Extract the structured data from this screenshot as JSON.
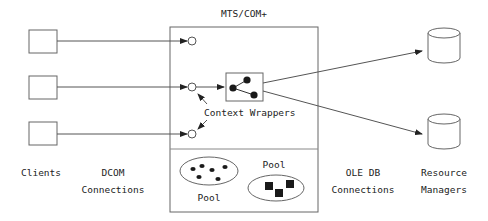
{
  "title": "MTS/COM+",
  "context_wrappers_label": "Context Wrappers",
  "pools": [
    {
      "label": "Pool",
      "shape": "dots",
      "count": 6
    },
    {
      "label": "Pool",
      "shape": "squares",
      "count": 3
    }
  ],
  "columns": {
    "clients": "Clients",
    "dcom": [
      "DCOM",
      "Connections"
    ],
    "oledb": [
      "OLE DB",
      "Connections"
    ],
    "resource_managers": [
      "Resource",
      "Managers"
    ]
  },
  "clients": [
    {
      "name": "client-1"
    },
    {
      "name": "client-2"
    },
    {
      "name": "client-3"
    }
  ],
  "resource_managers_items": [
    {
      "name": "database-1"
    },
    {
      "name": "database-2"
    }
  ],
  "colors": {
    "line": "#555555",
    "fill_dark": "#1a1a1a",
    "background": "#ffffff"
  }
}
